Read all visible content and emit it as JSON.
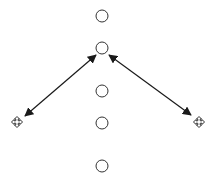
{
  "canvas": {
    "width": 222,
    "height": 184,
    "background": "#ffffff",
    "stroke_color": "#1a1a1a"
  },
  "nodes": [
    {
      "id": "node-1",
      "shape": "circle",
      "cx": 102,
      "cy": 16,
      "r": 6
    },
    {
      "id": "node-2",
      "shape": "circle",
      "cx": 102,
      "cy": 48,
      "r": 6
    },
    {
      "id": "node-3",
      "shape": "circle",
      "cx": 102,
      "cy": 91,
      "r": 6
    },
    {
      "id": "node-4",
      "shape": "circle",
      "cx": 102,
      "cy": 123,
      "r": 6
    },
    {
      "id": "node-5",
      "shape": "circle",
      "cx": 102,
      "cy": 166,
      "r": 6
    }
  ],
  "handles": [
    {
      "id": "move-handle-left",
      "icon": "move-icon",
      "cx": 17,
      "cy": 122
    },
    {
      "id": "move-handle-right",
      "icon": "move-icon",
      "cx": 199,
      "cy": 122
    }
  ],
  "arrows": [
    {
      "id": "arrow-left",
      "type": "double-headed",
      "from": [
        96,
        55
      ],
      "to": [
        25,
        116
      ]
    },
    {
      "id": "arrow-right",
      "type": "double-headed",
      "from": [
        109,
        55
      ],
      "to": [
        191,
        115
      ]
    }
  ]
}
